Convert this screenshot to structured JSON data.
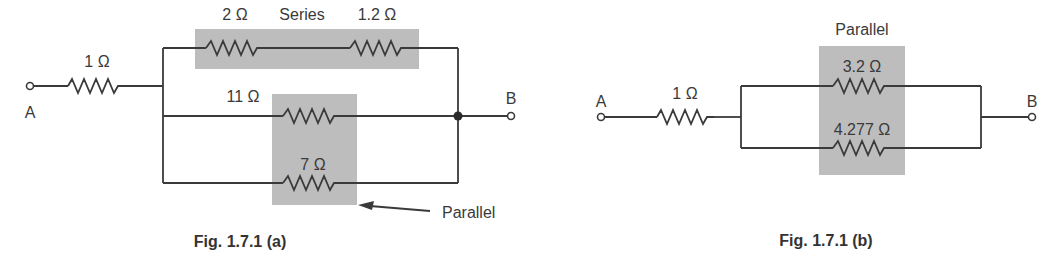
{
  "figure_a": {
    "caption": "Fig. 1.7.1 (a)",
    "terminal_a": "A",
    "terminal_b": "B",
    "r1_label": "1 Ω",
    "r2_label": "2 Ω",
    "series_label": "Series",
    "r3_label": "1.2 Ω",
    "r4_label": "11 Ω",
    "r5_label": "7 Ω",
    "parallel_label": "Parallel"
  },
  "figure_b": {
    "caption": "Fig. 1.7.1 (b)",
    "terminal_a": "A",
    "terminal_b": "B",
    "r1_label": "1 Ω",
    "parallel_label": "Parallel",
    "r2_label": "3.2 Ω",
    "r3_label": "4.277 Ω"
  },
  "colors": {
    "line": "#3a3a3a",
    "shade": "#bdbdbd"
  }
}
